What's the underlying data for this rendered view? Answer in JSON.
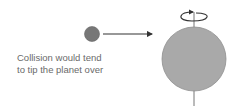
{
  "diagram": {
    "caption_lines": [
      "Collision would tend",
      "to tip the planet over"
    ],
    "colors": {
      "impactor": "#777777",
      "planet": "#a9a9a9",
      "planet_outline": "#8f8f8f",
      "arrow": "#333333",
      "axis": "#777777",
      "text": "#6a6a6a"
    },
    "elements": [
      "impactor-sphere",
      "motion-arrow",
      "planet",
      "rotation-axis",
      "spin-arrow"
    ]
  }
}
